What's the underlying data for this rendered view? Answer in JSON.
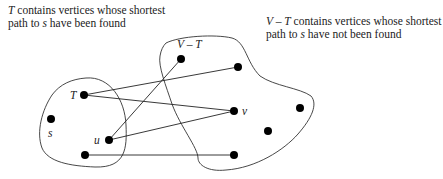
{
  "captions": {
    "left": {
      "symbol": "T",
      "text": " contains vertices whose shortest path to ",
      "var": "s",
      "text2": " have been found"
    },
    "right": {
      "symbol": "V – T",
      "text": " contains vertices whose shortest path to ",
      "var": "s",
      "text2": " have not been found"
    }
  },
  "regions": [
    {
      "id": "T",
      "label": "T"
    },
    {
      "id": "V-T",
      "label": "V – T"
    }
  ],
  "vertices": [
    {
      "id": "T",
      "x": 84,
      "y": 95,
      "label": "T",
      "region": "T"
    },
    {
      "id": "s",
      "x": 51,
      "y": 119,
      "label": "s",
      "region": "T"
    },
    {
      "id": "u",
      "x": 109,
      "y": 140,
      "label": "u",
      "region": "T"
    },
    {
      "id": "t4",
      "x": 85,
      "y": 155,
      "label": "",
      "region": "T"
    },
    {
      "id": "w1",
      "x": 181,
      "y": 59,
      "label": "",
      "region": "V-T"
    },
    {
      "id": "w2",
      "x": 238,
      "y": 67,
      "label": "",
      "region": "V-T"
    },
    {
      "id": "v",
      "x": 234,
      "y": 111,
      "label": "v",
      "region": "V-T"
    },
    {
      "id": "w3",
      "x": 300,
      "y": 108,
      "label": "",
      "region": "V-T"
    },
    {
      "id": "w4",
      "x": 268,
      "y": 131,
      "label": "",
      "region": "V-T"
    },
    {
      "id": "w5",
      "x": 234,
      "y": 155,
      "label": "",
      "region": "V-T"
    }
  ],
  "edges": [
    [
      "T",
      "w2"
    ],
    [
      "T",
      "v"
    ],
    [
      "u",
      "w1"
    ],
    [
      "u",
      "v"
    ],
    [
      "t4",
      "w5"
    ]
  ],
  "labels": {
    "T": "T",
    "s": "s",
    "u": "u",
    "v": "v",
    "VT": "V – T"
  }
}
